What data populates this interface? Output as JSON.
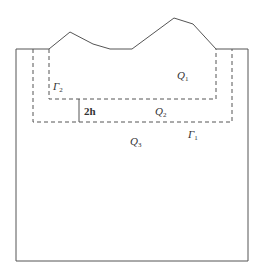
{
  "diagram": {
    "labels": {
      "q1": {
        "base": "Q",
        "sub": "1"
      },
      "q2": {
        "base": "Q",
        "sub": "2"
      },
      "q3": {
        "base": "Q",
        "sub": "3"
      },
      "gamma1": {
        "base": "Γ",
        "sub": "1"
      },
      "gamma2": {
        "base": "Γ",
        "sub": "2"
      },
      "thickness": "2h"
    },
    "colors": {
      "line": "#555555",
      "text": "#333333"
    }
  }
}
